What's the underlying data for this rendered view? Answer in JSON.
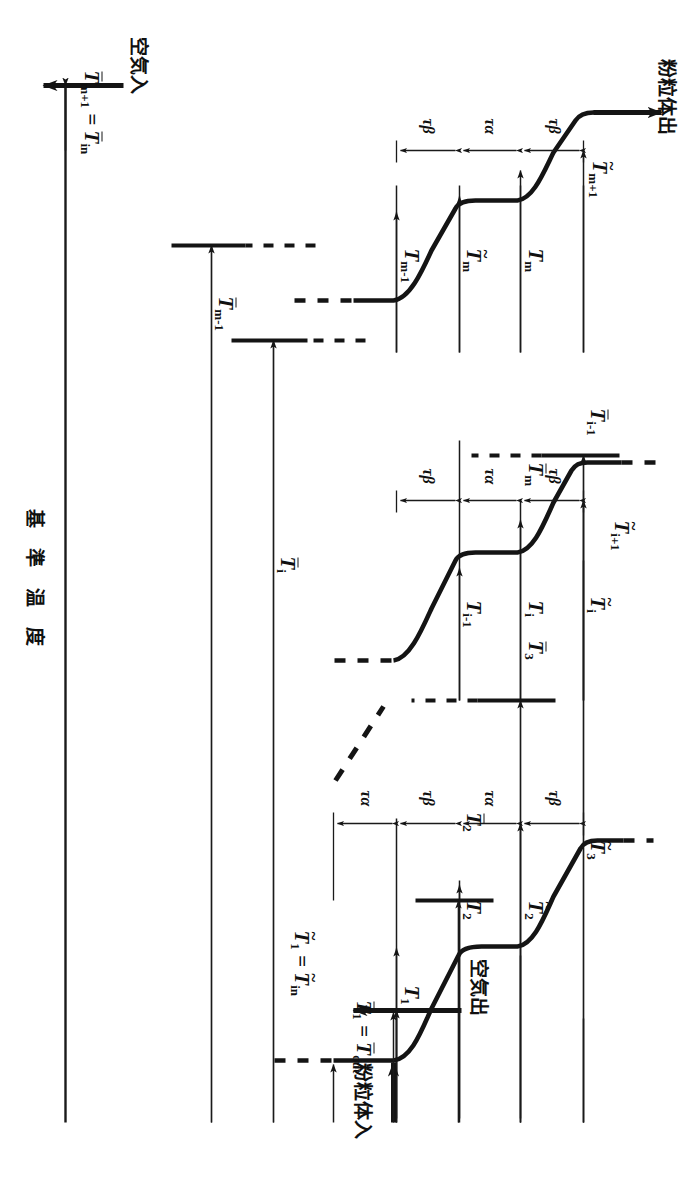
{
  "figure": {
    "type": "schematic-temperature-profile",
    "axis_label": "基 準 温 度",
    "flow_labels": {
      "solid_in": "粉粒体入",
      "solid_out": "粉粒体出",
      "air_in": "空気入",
      "air_out": "空気出"
    },
    "time_labels": {
      "tau_alpha": "τα",
      "tau_beta": "τβ"
    },
    "stage_groups": [
      {
        "name": "first-stages",
        "tau_sequence": [
          "τα",
          "τβ",
          "τα",
          "τβ"
        ],
        "solid_temps": [
          "T₁",
          "T₂"
        ],
        "solid_tilde_temps": [
          "T̃₂",
          "T̃₃"
        ],
        "air_temps": [
          "T̄₂",
          "T̄₃"
        ],
        "inlet_relation": "T̃₁ = T̃in",
        "outlet_relation": "T̄₁ = T̄out"
      },
      {
        "name": "i-th-stages",
        "tau_sequence": [
          "τβ",
          "τα",
          "τβ"
        ],
        "solid_temps": [
          "Tᵢ₋₁",
          "Tᵢ"
        ],
        "solid_tilde_temps": [
          "T̃ᵢ",
          "T̃ᵢ₊₁"
        ],
        "air_temps": [
          "T̄ᵢ₋₁",
          "T̄ᵢ"
        ]
      },
      {
        "name": "m-th-stages",
        "tau_sequence": [
          "τβ",
          "τα",
          "τβ"
        ],
        "solid_temps": [
          "Tₘ₋₁",
          "Tₘ"
        ],
        "solid_tilde_temps": [
          "T̃ₘ",
          "T̃ₘ₊₁"
        ],
        "air_temps": [
          "T̄ₘ₋₁",
          "T̄ₘ"
        ],
        "inlet_relation": "T̄ₘ₊₁ = T̄in"
      }
    ],
    "labels": {
      "T1": "T",
      "T1_sub": "1",
      "T2": "T",
      "T2_sub": "2",
      "Ti_minus_1": "T",
      "Ti_minus_1_sub": "i-1",
      "Ti": "T",
      "Ti_sub": "i",
      "Tm_minus_1": "T",
      "Tm_minus_1_sub": "m-1",
      "Tm": "T",
      "Tm_sub": "m",
      "tilde_T2": "T",
      "tilde_T2_sub": "2",
      "tilde_T3": "T",
      "tilde_T3_sub": "3",
      "tilde_Ti": "T",
      "tilde_Ti_sub": "i",
      "tilde_Ti_plus_1": "T",
      "tilde_Ti_plus_1_sub": "i+1",
      "tilde_Tm": "T",
      "tilde_Tm_sub": "m",
      "tilde_Tm_plus_1": "T",
      "tilde_Tm_plus_1_sub": "m+1",
      "bar_T2": "T",
      "bar_T2_sub": "2",
      "bar_T3": "T",
      "bar_T3_sub": "3",
      "bar_Ti_minus_1": "T",
      "bar_Ti_minus_1_sub": "i-1",
      "bar_Ti": "T",
      "bar_Ti_sub": "i",
      "bar_Tm_minus_1": "T",
      "bar_Tm_minus_1_sub": "m-1",
      "bar_Tm": "T",
      "bar_Tm_sub": "m",
      "eq": "=",
      "in_sub": "in",
      "out_sub": "out",
      "T": "T"
    },
    "colors": {
      "ink": "#1a1a1a",
      "paper": "#ffffff"
    }
  }
}
